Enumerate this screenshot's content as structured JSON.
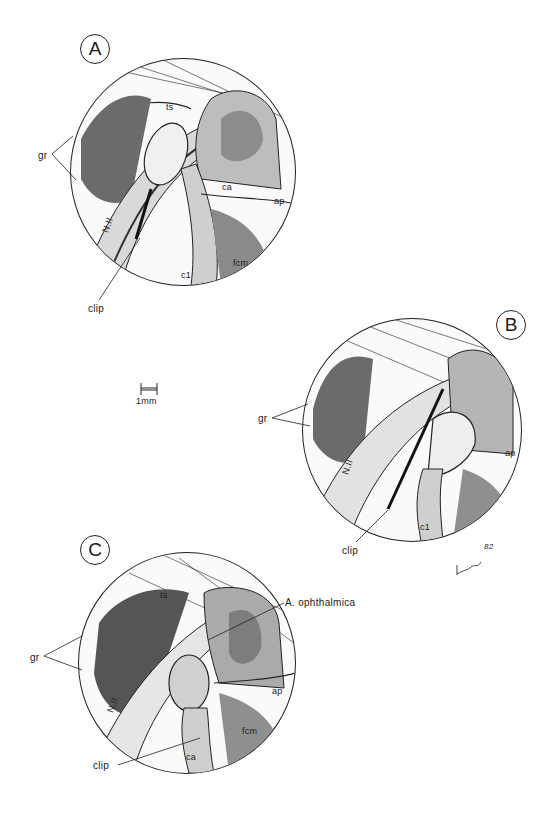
{
  "figure": {
    "panels": [
      {
        "letter": "A",
        "labels": {
          "gr": "gr",
          "ts": "ts",
          "nerve": "N.II",
          "ca": "ca",
          "ap": "ap",
          "fcm": "fcm",
          "c1": "c1",
          "clip": "clip"
        }
      },
      {
        "letter": "B",
        "labels": {
          "gr": "gr",
          "nerve": "N.II",
          "ap": "ap",
          "c1": "c1",
          "clip": "clip"
        }
      },
      {
        "letter": "C",
        "labels": {
          "gr": "gr",
          "ts": "ts",
          "nerve": "N.II",
          "artery": "A. ophthalmica",
          "ap": "ap",
          "fcm": "fcm",
          "ca": "ca",
          "clip": "clip"
        }
      }
    ],
    "scale_bar": {
      "label": "1mm"
    },
    "signature": "82"
  }
}
